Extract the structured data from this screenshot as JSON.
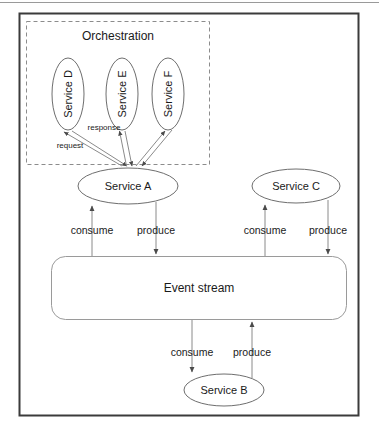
{
  "diagram": {
    "title_group": "Orchestration",
    "colors": {
      "outer_border": "#3b3b3b",
      "dashed_border": "#8c8c8c",
      "node_stroke": "#6e6e6e",
      "arrow_stroke": "#7a7a7a",
      "text": "#1a1a1a",
      "background": "#ffffff"
    },
    "orchestration": {
      "label": "Orchestration",
      "services": [
        {
          "id": "service-d",
          "label": "Service D",
          "cx": 68,
          "cy": 94,
          "rx": 16,
          "ry": 36
        },
        {
          "id": "service-e",
          "label": "Service E",
          "cx": 122,
          "cy": 94,
          "rx": 16,
          "ry": 36
        },
        {
          "id": "service-f",
          "label": "Service F",
          "cx": 168,
          "cy": 94,
          "rx": 16,
          "ry": 36
        }
      ],
      "edge_labels": [
        {
          "id": "response-label",
          "text": "response",
          "x": 104,
          "y": 128
        },
        {
          "id": "request-label",
          "text": "request",
          "x": 70,
          "y": 146
        }
      ]
    },
    "services": [
      {
        "id": "service-a",
        "label": "Service A",
        "cx": 128,
        "cy": 186,
        "rx": 50,
        "ry": 18
      },
      {
        "id": "service-c",
        "label": "Service C",
        "cx": 296,
        "cy": 186,
        "rx": 44,
        "ry": 17
      },
      {
        "id": "service-b",
        "label": "Service B",
        "cx": 224,
        "cy": 390,
        "rx": 40,
        "ry": 16
      }
    ],
    "event_stream": {
      "id": "event-stream",
      "label": "Event stream",
      "x": 51,
      "y": 256,
      "width": 296,
      "height": 64,
      "cx": 199,
      "cy": 288
    },
    "flow_labels": [
      {
        "id": "service-a-consume",
        "text": "consume",
        "x": 92,
        "y": 230
      },
      {
        "id": "service-a-produce",
        "text": "produce",
        "x": 156,
        "y": 230
      },
      {
        "id": "service-c-consume",
        "text": "consume",
        "x": 265,
        "y": 230
      },
      {
        "id": "service-c-produce",
        "text": "produce",
        "x": 328,
        "y": 230
      },
      {
        "id": "service-b-consume",
        "text": "consume",
        "x": 192,
        "y": 352
      },
      {
        "id": "service-b-produce",
        "text": "produce",
        "x": 252,
        "y": 352
      }
    ]
  }
}
